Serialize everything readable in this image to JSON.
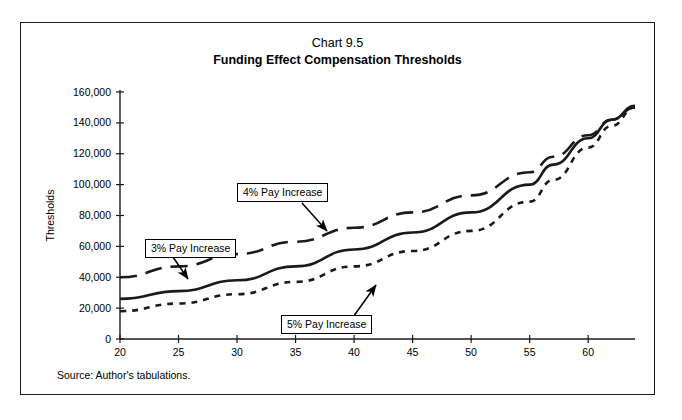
{
  "figure": {
    "title_line1": "Chart 9.5",
    "title_line2": "Funding Effect Compensation Thresholds",
    "source_note": "Source: Author's tabulations."
  },
  "annotations": {
    "label_3pct": "3% Pay Increase",
    "label_4pct": "4% Pay Increase",
    "label_5pct": "5% Pay Increase"
  },
  "chart_data": {
    "type": "line",
    "title": "Funding Effect Compensation Thresholds",
    "subtitle": "Chart 9.5",
    "xlabel": "",
    "ylabel": "Thresholds",
    "xlim": [
      20,
      64
    ],
    "ylim": [
      0,
      160000
    ],
    "xticks": [
      20,
      25,
      30,
      35,
      40,
      45,
      50,
      55,
      60
    ],
    "xtick_labels": [
      "20",
      "25",
      "30",
      "35",
      "40",
      "45",
      "50",
      "55",
      "60"
    ],
    "yticks": [
      0,
      20000,
      40000,
      60000,
      80000,
      100000,
      120000,
      140000,
      160000
    ],
    "ytick_labels": [
      "0",
      "20,000",
      "40,000",
      "60,000",
      "80,000",
      "100,000",
      "120,000",
      "140,000",
      "160,000"
    ],
    "grid": false,
    "legend": "inline-callouts",
    "x": [
      20,
      25,
      30,
      35,
      40,
      45,
      50,
      55,
      57,
      60,
      62,
      64
    ],
    "series": [
      {
        "name": "3% Pay Increase",
        "dash": "long-dash",
        "color": "#1a1a1a",
        "values": [
          40000,
          47000,
          55000,
          63000,
          72000,
          82000,
          93000,
          108000,
          118000,
          132000,
          142000,
          150000
        ]
      },
      {
        "name": "4% Pay Increase",
        "dash": "solid",
        "color": "#1a1a1a",
        "values": [
          26000,
          31000,
          38000,
          47000,
          58000,
          69000,
          82000,
          100000,
          113000,
          130000,
          142000,
          151000
        ]
      },
      {
        "name": "5% Pay Increase",
        "dash": "short-dash",
        "color": "#1a1a1a",
        "values": [
          18000,
          23000,
          29000,
          37000,
          47000,
          57000,
          70000,
          89000,
          103000,
          124000,
          138000,
          150000
        ]
      }
    ]
  }
}
